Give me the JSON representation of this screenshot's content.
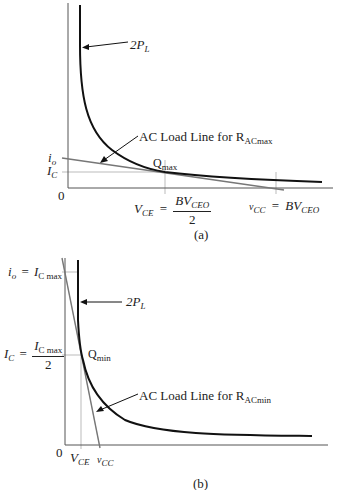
{
  "figure_a": {
    "caption": "(a)",
    "curve_label": "2P",
    "curve_label_sub": "L",
    "load_line_label": "AC Load Line for R",
    "load_line_label_sub": "ACmax",
    "q_label": "Q",
    "q_label_sub": "max",
    "origin_label": "0",
    "y_labels": {
      "io": "i",
      "io_sub": "o",
      "ic": "I",
      "ic_sub": "C"
    },
    "x_labels": {
      "vce": "V",
      "vce_sub": "CE",
      "eq1": "=",
      "vce_num": "BV",
      "vce_num_sub": "CEO",
      "vce_den": "2",
      "vcc": "v",
      "vcc_sub": "CC",
      "eq2": "=",
      "vcc_val": "BV",
      "vcc_val_sub": "CEO"
    }
  },
  "figure_b": {
    "caption": "(b)",
    "curve_label": "2P",
    "curve_label_sub": "L",
    "load_line_label": "AC Load Line for R",
    "load_line_label_sub": "ACmin",
    "q_label": "Q",
    "q_label_sub": "min",
    "origin_label": "0",
    "y_labels": {
      "io": "i",
      "io_sub": "o",
      "eq1": "=",
      "icmax": "I",
      "icmax_sub": "C max",
      "ic": "I",
      "ic_sub": "C",
      "eq2": "=",
      "ic_num": "I",
      "ic_num_sub": "C max",
      "ic_den": "2"
    },
    "x_labels": {
      "vce": "V",
      "vce_sub": "CE",
      "vcc": "v",
      "vcc_sub": "CC"
    }
  },
  "colors": {
    "curve": "#111111",
    "axis": "#555555",
    "load_line": "#777777",
    "guide": "#aaaaaa"
  }
}
